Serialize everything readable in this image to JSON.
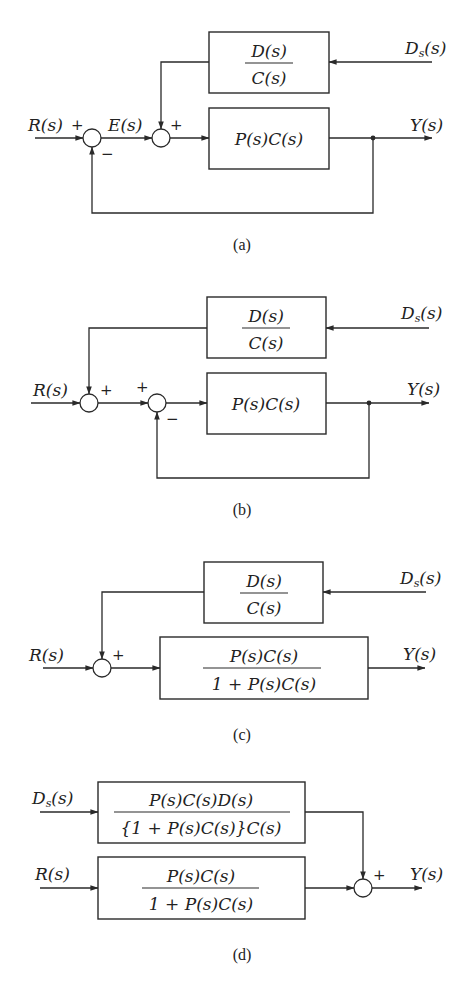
{
  "colors": {
    "line": "#2a2a2a",
    "text": "#222222",
    "background": "#ffffff"
  },
  "diagrams": [
    {
      "caption": "(a)",
      "inputs": {
        "reference": "R(s)",
        "disturbance_base": "D",
        "disturbance_sub": "s",
        "disturbance_arg": "(s)"
      },
      "error_label": "E(s)",
      "output": "Y(s)",
      "blocks": {
        "disturbance": {
          "numerator": "D(s)",
          "denominator": "C(s)"
        },
        "forward": {
          "expr": "P(s)C(s)"
        }
      },
      "signs": {
        "sum1_plus": "+",
        "sum1_minus": "−",
        "sum2_plus": "+"
      }
    },
    {
      "caption": "(b)",
      "inputs": {
        "reference": "R(s)",
        "disturbance_base": "D",
        "disturbance_sub": "s",
        "disturbance_arg": "(s)"
      },
      "output": "Y(s)",
      "blocks": {
        "disturbance": {
          "numerator": "D(s)",
          "denominator": "C(s)"
        },
        "forward": {
          "expr": "P(s)C(s)"
        }
      },
      "signs": {
        "sum1_plus": "+",
        "sum2_plus": "+",
        "sum2_minus": "−"
      }
    },
    {
      "caption": "(c)",
      "inputs": {
        "reference": "R(s)",
        "disturbance_base": "D",
        "disturbance_sub": "s",
        "disturbance_arg": "(s)"
      },
      "output": "Y(s)",
      "blocks": {
        "disturbance": {
          "numerator": "D(s)",
          "denominator": "C(s)"
        },
        "closed_loop": {
          "numerator": "P(s)C(s)",
          "denominator": "1 + P(s)C(s)"
        }
      },
      "signs": {
        "sum_plus": "+"
      }
    },
    {
      "caption": "(d)",
      "inputs": {
        "reference": "R(s)",
        "disturbance_base": "D",
        "disturbance_sub": "s",
        "disturbance_arg": "(s)"
      },
      "output": "Y(s)",
      "blocks": {
        "disturbance_path": {
          "numerator": "P(s)C(s)D(s)",
          "denominator": "{1 + P(s)C(s)}C(s)"
        },
        "reference_path": {
          "numerator": "P(s)C(s)",
          "denominator": "1 + P(s)C(s)"
        }
      },
      "signs": {
        "sum_plus": "+"
      }
    }
  ]
}
